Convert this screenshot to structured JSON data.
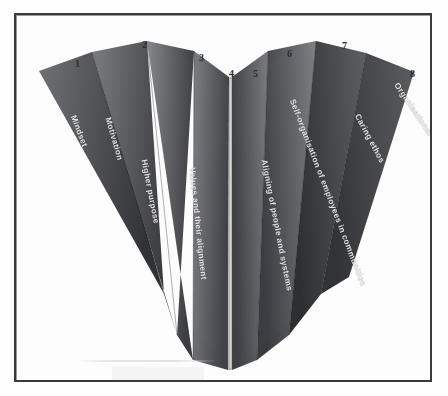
{
  "figure": {
    "shape": "heart",
    "panel_count": 8,
    "background_color": "#ffffff",
    "frame_color": "#3a3a3c",
    "label_color": "#f2f2f0",
    "number_color": "#2d2d2f"
  },
  "panels": [
    {
      "number": "1",
      "label": "Mindset",
      "side": "left",
      "fill_start": "#6f7073",
      "fill_end": "#2f3033",
      "num_x": 59,
      "num_y": 44,
      "label_x": 57,
      "label_y": 96,
      "label_rotation": 69
    },
    {
      "number": "2",
      "label": "Motivation",
      "side": "left",
      "fill_start": "#7b7c7f",
      "fill_end": "#35363a",
      "num_x": 126,
      "num_y": 25,
      "label_x": 92,
      "label_y": 98,
      "label_rotation": 74
    },
    {
      "number": "3",
      "label": "Higher purpose",
      "side": "left",
      "fill_start": "#85868a",
      "fill_end": "#3c3d41",
      "num_x": 183,
      "num_y": 38,
      "label_x": 128,
      "label_y": 140,
      "label_rotation": 79
    },
    {
      "number": "4",
      "label": "Values and their alignment",
      "side": "left",
      "fill_start": "#7d7e82",
      "fill_end": "#404146",
      "num_x": 213,
      "num_y": 54,
      "label_x": 176,
      "label_y": 148,
      "label_rotation": 84
    },
    {
      "number": "5",
      "label": "Aligning of people and systems",
      "side": "right",
      "fill_start": "#7a7b7f",
      "fill_end": "#3e3f44",
      "num_x": 237,
      "num_y": 54,
      "label_x": 248,
      "label_y": 140,
      "label_rotation": 79
    },
    {
      "number": "6",
      "label": "Self-organisation of employees in communities",
      "side": "right",
      "fill_start": "#7e7f83",
      "fill_end": "#3a3b40",
      "num_x": 271,
      "num_y": 34,
      "label_x": 276,
      "label_y": 80,
      "label_rotation": 69
    },
    {
      "number": "7",
      "label": "Caring ethos",
      "side": "right",
      "fill_start": "#5d5e62",
      "fill_end": "#2c2d31",
      "num_x": 326,
      "num_y": 26,
      "label_x": 341,
      "label_y": 95,
      "label_rotation": 62
    },
    {
      "number": "8",
      "label": "Organisational learning processes",
      "side": "right",
      "fill_start": "#5a5b5f",
      "fill_end": "#303135",
      "num_x": 394,
      "num_y": 54,
      "label_x": 380,
      "label_y": 64,
      "label_rotation": 56
    }
  ],
  "center_seam": {
    "color": "#b5b6b3",
    "label": "center-fold"
  }
}
